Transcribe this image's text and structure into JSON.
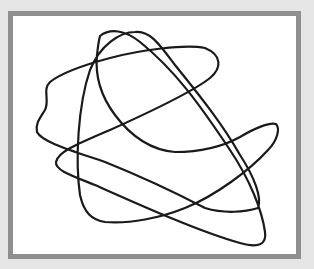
{
  "canvas": {
    "background_color": "#e6e6e6",
    "frame_border_color": "#8f8f8f",
    "frame_fill_color": "#ffffff"
  },
  "drawing": {
    "description": "scribble-loop",
    "stroke_color": "#1a1a1a",
    "stroke_width": 2.2
  }
}
